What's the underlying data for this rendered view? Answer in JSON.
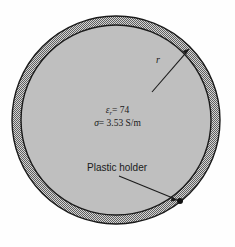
{
  "figure": {
    "caption_labels": {
      "radius": "r",
      "permittivity_symbol": "ε",
      "permittivity_subscript": "r",
      "permittivity_equals_value": "= 74",
      "permittivity_full": "εr = 74",
      "conductivity_symbol": "σ",
      "conductivity_equals_value": "= 3.53 S/m",
      "conductivity_full": "σ = 3.53 S/m",
      "plastic_holder": "Plastic holder"
    },
    "values": {
      "relative_permittivity": 74,
      "conductivity": 3.53,
      "conductivity_units": "S/m"
    },
    "geometry": {
      "center_x": 116,
      "center_y": 120,
      "outer_radius": 104,
      "inner_radius": 95,
      "wall_thickness": 9
    },
    "annotations": {
      "radius_arrow": {
        "x1": 152,
        "y1": 92,
        "x2": 189,
        "y2": 49
      },
      "holder_arrow": {
        "x1": 119,
        "y1": 176,
        "x2": 178,
        "y2": 200
      },
      "holder_marker_dot": {
        "cx": 180,
        "cy": 201,
        "r": 3
      }
    },
    "colors": {
      "background": "#fefefe",
      "interior_fill": "#bfbfbf",
      "wall_hatch_dark": "#595959",
      "wall_hatch_light": "#d4d4d4",
      "outline": "#1a1a1a",
      "text": "#1a1a1a"
    }
  }
}
